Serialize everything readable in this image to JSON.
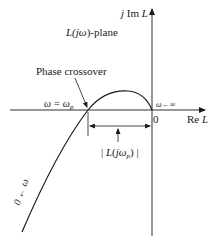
{
  "diagram": {
    "type": "nyquist-plot",
    "plane_label": {
      "prefix": "L(",
      "j": "j",
      "omega": "ω",
      "suffix": ")-plane"
    },
    "imag_axis_label": {
      "j": "j",
      "text": " Im ",
      "var": "L"
    },
    "real_axis_label": {
      "text": "Re ",
      "var": "L"
    },
    "origin_label": "0",
    "phase_crossover_label": "Phase crossover",
    "omega_p_label": {
      "lhs": "ω = ω",
      "sub": "p"
    },
    "omega_inf_label": "ω←∞",
    "magnitude_label": {
      "open": "| ",
      "L": "L",
      "paren_open": "(",
      "jw": "jω",
      "sub": "p",
      "paren_close": ")",
      "close": " |"
    },
    "omega_zero_label": "0 ← ω",
    "colors": {
      "line": "#1a1a1a",
      "background": "#ffffff"
    }
  }
}
